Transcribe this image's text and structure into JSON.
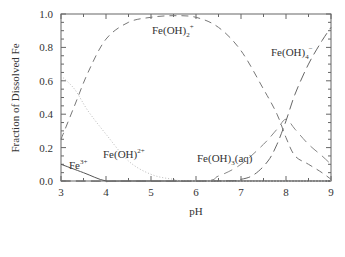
{
  "chart_data": {
    "type": "line",
    "title": "",
    "xlabel": "pH",
    "ylabel": "Fraction of Dissolved Fe",
    "xlim": [
      3,
      9
    ],
    "ylim": [
      0,
      1.0
    ],
    "xticks": [
      "3",
      "4",
      "5",
      "6",
      "7",
      "8",
      "9"
    ],
    "yticks": [
      "0.0",
      "0.2",
      "0.4",
      "0.6",
      "0.8",
      "1.0"
    ],
    "grid": false,
    "legend": "inline curve labels",
    "series": [
      {
        "name": "Fe3+",
        "label_main": "Fe",
        "label_sup": "3+",
        "style": "solid",
        "x": [
          3.0,
          3.5,
          4.0,
          4.5,
          9.0
        ],
        "y": [
          0.1,
          0.05,
          0.0,
          0.0,
          0.0
        ]
      },
      {
        "name": "Fe(OH)2+",
        "label_main": "Fe(OH)",
        "label_sup": "2+",
        "style": "dotted",
        "x": [
          3.0,
          3.3,
          3.6,
          4.0,
          4.5,
          5.0,
          5.5,
          6.0,
          9.0
        ],
        "y": [
          0.63,
          0.55,
          0.42,
          0.28,
          0.12,
          0.04,
          0.01,
          0.0,
          0.0
        ]
      },
      {
        "name": "Fe(OH)2+ (dihydroxo)",
        "label_main": "Fe(OH)",
        "label_sub": "2",
        "label_sup": "+",
        "style": "dashed",
        "x": [
          3.0,
          3.3,
          3.6,
          4.0,
          4.5,
          5.0,
          5.5,
          6.0,
          6.5,
          7.0,
          7.5,
          7.8,
          8.0,
          8.2,
          8.5,
          8.8,
          9.0
        ],
        "y": [
          0.25,
          0.45,
          0.65,
          0.85,
          0.95,
          0.98,
          0.99,
          0.98,
          0.92,
          0.78,
          0.55,
          0.4,
          0.26,
          0.15,
          0.1,
          0.05,
          0.01
        ]
      },
      {
        "name": "Fe(OH)3(aq)",
        "label_main": "Fe(OH)",
        "label_sub": "3",
        "label_tail": "(aq)",
        "style": "dash-dot",
        "x": [
          3.0,
          6.0,
          6.5,
          7.0,
          7.5,
          7.8,
          8.0,
          8.2,
          8.5,
          8.8,
          9.0
        ],
        "y": [
          0.0,
          0.0,
          0.03,
          0.1,
          0.22,
          0.31,
          0.37,
          0.31,
          0.22,
          0.15,
          0.1
        ]
      },
      {
        "name": "Fe(OH)4-",
        "label_main": "Fe(OH)",
        "label_sub": "4",
        "label_sup": "−",
        "style": "long-dash",
        "x": [
          3.0,
          6.5,
          7.0,
          7.3,
          7.6,
          7.8,
          8.0,
          8.2,
          8.5,
          8.8,
          9.0
        ],
        "y": [
          0.0,
          0.0,
          0.01,
          0.04,
          0.12,
          0.22,
          0.36,
          0.52,
          0.7,
          0.84,
          0.92
        ]
      }
    ]
  }
}
